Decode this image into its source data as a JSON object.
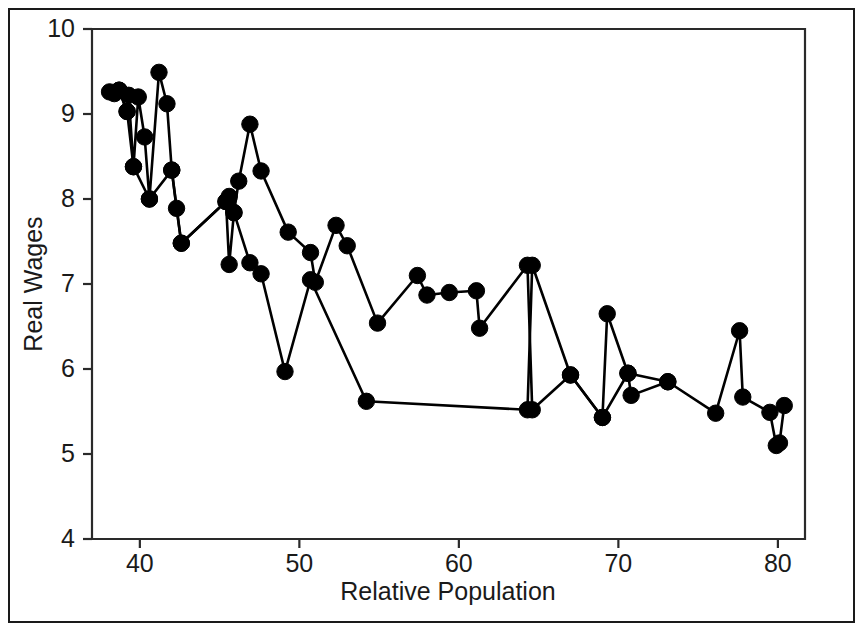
{
  "chart_data": {
    "type": "line",
    "title": "",
    "xlabel": "Relative Population",
    "ylabel": "Real Wages",
    "xlim": [
      37.0,
      81.7
    ],
    "ylim": [
      4,
      10
    ],
    "xticks": [
      40,
      50,
      60,
      70,
      80
    ],
    "yticks": [
      4,
      5,
      6,
      7,
      8,
      9,
      10
    ],
    "xticklabels": [
      "40",
      "50",
      "60",
      "70",
      "80"
    ],
    "yticklabels": [
      "4",
      "5",
      "6",
      "7",
      "8",
      "9",
      "10"
    ],
    "grid": false,
    "legend": false,
    "marker": "filled-circle",
    "marker_color": "#000000",
    "line_color": "#000000",
    "series": [
      {
        "name": "upper-path",
        "points": [
          [
            38.1,
            9.26
          ],
          [
            38.4,
            9.24
          ],
          [
            38.7,
            9.28
          ],
          [
            39.2,
            9.03
          ],
          [
            39.3,
            9.22
          ],
          [
            39.6,
            8.38
          ],
          [
            39.9,
            9.2
          ],
          [
            40.3,
            8.73
          ],
          [
            40.6,
            8.0
          ],
          [
            41.2,
            9.49
          ],
          [
            41.7,
            9.12
          ],
          [
            42.0,
            8.34
          ],
          [
            42.3,
            7.89
          ],
          [
            42.6,
            7.48
          ],
          [
            45.4,
            7.97
          ],
          [
            45.6,
            8.03
          ],
          [
            45.9,
            7.84
          ],
          [
            46.2,
            8.21
          ],
          [
            46.9,
            8.88
          ],
          [
            47.6,
            8.33
          ],
          [
            49.3,
            7.61
          ],
          [
            50.7,
            7.37
          ],
          [
            51.0,
            7.02
          ],
          [
            52.3,
            7.69
          ],
          [
            53.0,
            7.45
          ],
          [
            54.9,
            6.54
          ],
          [
            57.4,
            7.1
          ],
          [
            58.0,
            6.87
          ],
          [
            59.4,
            6.9
          ],
          [
            61.1,
            6.92
          ],
          [
            61.3,
            6.48
          ],
          [
            64.3,
            7.22
          ],
          [
            64.6,
            5.52
          ],
          [
            67.0,
            5.93
          ],
          [
            69.0,
            5.43
          ],
          [
            69.3,
            6.65
          ],
          [
            70.6,
            5.95
          ],
          [
            70.8,
            5.69
          ],
          [
            73.1,
            5.85
          ],
          [
            76.1,
            5.48
          ],
          [
            77.6,
            6.45
          ],
          [
            77.8,
            5.67
          ],
          [
            79.5,
            5.49
          ],
          [
            79.9,
            5.1
          ],
          [
            80.1,
            5.13
          ],
          [
            80.4,
            5.57
          ]
        ]
      },
      {
        "name": "lower-path",
        "points": [
          [
            38.7,
            9.28
          ],
          [
            39.2,
            9.03
          ],
          [
            39.6,
            8.38
          ],
          [
            40.6,
            8.0
          ],
          [
            42.0,
            8.34
          ],
          [
            42.6,
            7.48
          ],
          [
            45.4,
            7.97
          ],
          [
            45.6,
            7.23
          ],
          [
            45.9,
            7.84
          ],
          [
            46.9,
            7.25
          ],
          [
            47.6,
            7.12
          ],
          [
            49.1,
            5.97
          ],
          [
            50.7,
            7.05
          ],
          [
            54.2,
            5.62
          ],
          [
            64.3,
            5.52
          ],
          [
            64.6,
            7.22
          ],
          [
            67.0,
            5.93
          ],
          [
            69.0,
            5.43
          ],
          [
            70.6,
            5.95
          ],
          [
            73.1,
            5.85
          ]
        ]
      }
    ]
  },
  "axes": {
    "plot_left_px": 92,
    "plot_right_px": 805,
    "plot_top_px": 29,
    "plot_bottom_px": 539
  }
}
